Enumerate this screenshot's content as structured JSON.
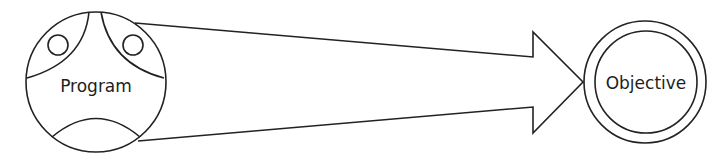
{
  "diagram": {
    "source_node": {
      "label": "Program"
    },
    "target_node": {
      "label": "Objective"
    },
    "connector": {
      "type": "tapered-arrow",
      "direction": "source-to-target"
    },
    "colors": {
      "stroke": "#222222",
      "background": "#ffffff",
      "text": "#1e1e1e"
    }
  }
}
